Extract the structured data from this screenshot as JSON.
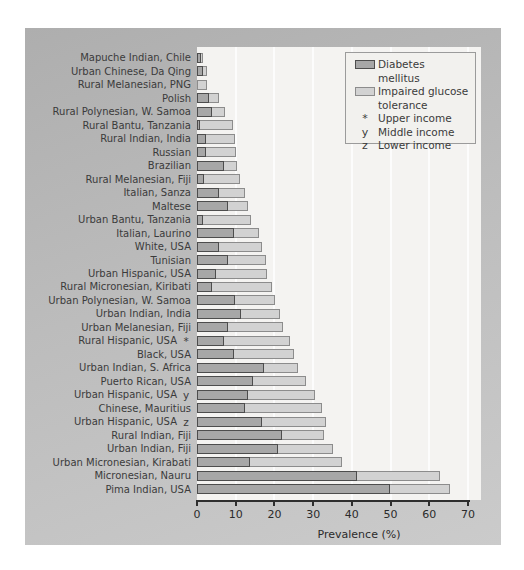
{
  "chart_data": {
    "type": "bar",
    "orientation": "horizontal",
    "stacked": true,
    "title": "",
    "xlabel": "Prevalence (%)",
    "xlim": [
      0,
      70
    ],
    "x_ticks": [
      0,
      10,
      20,
      30,
      40,
      50,
      60,
      70
    ],
    "grid": "vertical-white-lines-every-10",
    "series_names": [
      "Diabetes mellitus",
      "Impaired glucose tolerance"
    ],
    "legend": {
      "position": "top-right",
      "items": [
        {
          "swatch": "dark",
          "symbol": "",
          "label": "Diabetes mellitus"
        },
        {
          "swatch": "light",
          "symbol": "",
          "label": "Impaired glucose tolerance"
        },
        {
          "swatch": "",
          "symbol": "*",
          "label": "Upper income"
        },
        {
          "swatch": "",
          "symbol": "y",
          "label": "Middle income"
        },
        {
          "swatch": "",
          "symbol": "z",
          "label": "Lower income"
        }
      ]
    },
    "rows": [
      {
        "label": "Mapuche Indian, Chile",
        "marker": "",
        "diabetes": 1.0,
        "igt": 0.5
      },
      {
        "label": "Urban Chinese, Da Qing",
        "marker": "",
        "diabetes": 1.5,
        "igt": 1.0
      },
      {
        "label": "Rural Melanesian, PNG",
        "marker": "",
        "diabetes": 0.0,
        "igt": 2.5
      },
      {
        "label": "Polish",
        "marker": "",
        "diabetes": 3.0,
        "igt": 2.8
      },
      {
        "label": "Rural Polynesian, W. Samoa",
        "marker": "",
        "diabetes": 4.0,
        "igt": 3.2
      },
      {
        "label": "Rural Bantu, Tanzania",
        "marker": "",
        "diabetes": 0.8,
        "igt": 8.5
      },
      {
        "label": "Rural Indian, India",
        "marker": "",
        "diabetes": 2.2,
        "igt": 7.5
      },
      {
        "label": "Russian",
        "marker": "",
        "diabetes": 2.3,
        "igt": 7.9
      },
      {
        "label": "Brazilian",
        "marker": "",
        "diabetes": 7.1,
        "igt": 3.3
      },
      {
        "label": "Rural Melanesian, Fiji",
        "marker": "",
        "diabetes": 1.8,
        "igt": 9.2
      },
      {
        "label": "Italian, Sanza",
        "marker": "",
        "diabetes": 5.8,
        "igt": 6.7
      },
      {
        "label": "Maltese",
        "marker": "",
        "diabetes": 8.0,
        "igt": 5.1
      },
      {
        "label": "Urban Bantu, Tanzania",
        "marker": "",
        "diabetes": 1.5,
        "igt": 12.5
      },
      {
        "label": "Italian, Laurino",
        "marker": "",
        "diabetes": 9.6,
        "igt": 6.5
      },
      {
        "label": "White, USA",
        "marker": "",
        "diabetes": 5.8,
        "igt": 11.0
      },
      {
        "label": "Tunisian",
        "marker": "",
        "diabetes": 7.9,
        "igt": 9.9
      },
      {
        "label": "Urban Hispanic, USA",
        "marker": "",
        "diabetes": 4.9,
        "igt": 13.2
      },
      {
        "label": "Rural Micronesian, Kiribati",
        "marker": "",
        "diabetes": 3.8,
        "igt": 15.6
      },
      {
        "label": "Urban Polynesian, W. Samoa",
        "marker": "",
        "diabetes": 9.9,
        "igt": 10.3
      },
      {
        "label": "Urban Indian, India",
        "marker": "",
        "diabetes": 11.4,
        "igt": 10.1
      },
      {
        "label": "Urban Melanesian, Fiji",
        "marker": "",
        "diabetes": 7.9,
        "igt": 14.2
      },
      {
        "label": "Rural Hispanic, USA",
        "marker": "*",
        "diabetes": 6.9,
        "igt": 17.0
      },
      {
        "label": "Black, USA",
        "marker": "",
        "diabetes": 9.5,
        "igt": 15.6
      },
      {
        "label": "Urban Indian, S. Africa",
        "marker": "",
        "diabetes": 17.2,
        "igt": 9.0
      },
      {
        "label": "Puerto Rican, USA",
        "marker": "",
        "diabetes": 14.4,
        "igt": 13.8
      },
      {
        "label": "Urban Hispanic, USA",
        "marker": "y",
        "diabetes": 13.1,
        "igt": 17.5
      },
      {
        "label": "Chinese, Mauritius",
        "marker": "",
        "diabetes": 12.5,
        "igt": 19.8
      },
      {
        "label": "Urban Hispanic, USA",
        "marker": "z",
        "diabetes": 16.8,
        "igt": 16.4
      },
      {
        "label": "Rural Indian, Fiji",
        "marker": "",
        "diabetes": 21.9,
        "igt": 11.0
      },
      {
        "label": "Urban Indian, Fiji",
        "marker": "",
        "diabetes": 20.9,
        "igt": 14.2
      },
      {
        "label": "Urban Micronesian, Kirabati",
        "marker": "",
        "diabetes": 13.8,
        "igt": 23.6
      },
      {
        "label": "Micronesian, Nauru",
        "marker": "",
        "diabetes": 41.2,
        "igt": 21.5
      },
      {
        "label": "Pima Indian, USA",
        "marker": "",
        "diabetes": 49.8,
        "igt": 15.5
      }
    ]
  },
  "colors": {
    "panel_bg": "#bcbcbc",
    "plot_bg": "#f4f3f1",
    "diabetes_fill": "#a7a7a7",
    "diabetes_border": "#4d4d4d",
    "igt_fill": "#d2d2d2",
    "igt_border": "#8c8c8c",
    "gridline": "#ffffff",
    "axis": "#2e2e2e",
    "text": "#3b3b3b",
    "legend_bg": "#f2f1ee"
  }
}
